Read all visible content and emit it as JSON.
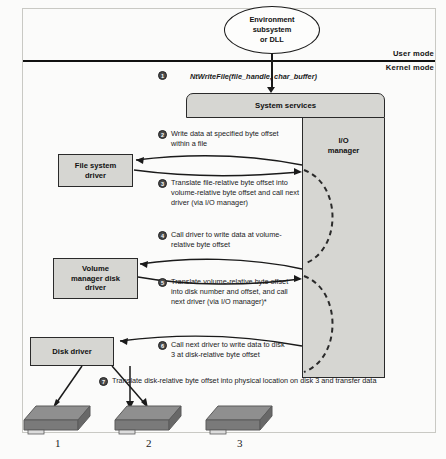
{
  "diagram": {
    "mode_labels": {
      "user": "User mode",
      "kernel": "Kernel mode"
    },
    "nodes": {
      "environment_subsystem": [
        "Environment",
        "subsystem",
        "or DLL"
      ],
      "system_services": "System services",
      "io_manager": [
        "I/O",
        "manager"
      ],
      "file_system_driver": [
        "File system",
        "driver"
      ],
      "volume_manager_disk_driver": [
        "Volume",
        "manager disk",
        "driver"
      ],
      "disk_driver": "Disk driver"
    },
    "api_call": "NtWriteFile(file_handle, char_buffer)",
    "steps": [
      {
        "number": "1",
        "text": ""
      },
      {
        "number": "2",
        "text": "Write data at specified byte offset within a file"
      },
      {
        "number": "3",
        "text": "Translate file-relative byte offset into volume-relative byte offset and call next driver (via I/O manager)"
      },
      {
        "number": "4",
        "text": "Call driver to write data at volume-relative byte offset"
      },
      {
        "number": "5",
        "text": "Translate volume-relative byte offset into disk number and offset, and call next driver (via I/O manager)*"
      },
      {
        "number": "6",
        "text": "Call next driver to write data to disk 3 at disk-relative byte offset"
      },
      {
        "number": "7",
        "text": "Translate disk-relative byte offset into physical location on disk 3 and transfer data"
      }
    ],
    "disks": [
      {
        "label": "1"
      },
      {
        "label": "2"
      },
      {
        "label": "3"
      }
    ],
    "colors": {
      "box_fill": "#d6d6d2",
      "box_stroke": "#2a2a2a",
      "line": "#1a1a1a",
      "disk_top": "#8f8f8f",
      "disk_side": "#6f6f6f",
      "step_marker": "#4a4a4a"
    }
  }
}
